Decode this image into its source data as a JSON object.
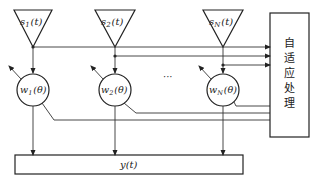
{
  "diagram": {
    "sources": [
      {
        "id": "s1",
        "label_main": "s",
        "label_sub": "1",
        "label_arg": "(t)"
      },
      {
        "id": "s2",
        "label_main": "s",
        "label_sub": "2",
        "label_arg": "(t)"
      },
      {
        "id": "sN",
        "label_main": "s",
        "label_sub": "N",
        "label_arg": "(t)"
      }
    ],
    "weights": [
      {
        "id": "w1",
        "label_main": "w",
        "label_sub": "1",
        "label_arg": "(θ)"
      },
      {
        "id": "w2",
        "label_main": "w",
        "label_sub": "2",
        "label_arg": "(θ)"
      },
      {
        "id": "wN",
        "label_main": "w",
        "label_sub": "N",
        "label_arg": "(θ)"
      }
    ],
    "ellipsis": "···",
    "output": {
      "label": "y(t)"
    },
    "adaptive_box": {
      "chars": [
        "自",
        "适",
        "应",
        "处",
        "理"
      ]
    }
  }
}
